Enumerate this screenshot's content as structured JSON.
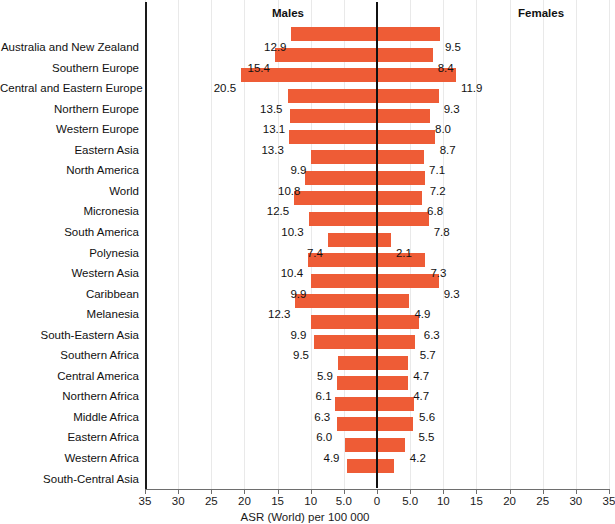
{
  "chart_data": {
    "type": "bar",
    "subtype": "population-pyramid",
    "title": "",
    "xlabel": "ASR (World) per 100 000",
    "ylabel": "",
    "grid": true,
    "legend_position": "top",
    "bar_color": "#ee5c36",
    "xlim": [
      -35,
      35
    ],
    "xticks": [
      35,
      30,
      25,
      20,
      15,
      10,
      5.0,
      0,
      5.0,
      10,
      15,
      20,
      25,
      30,
      35
    ],
    "xtick_labels": [
      "35",
      "30",
      "25",
      "20",
      "15",
      "10",
      "5.0",
      "0",
      "5.0",
      "10",
      "15",
      "20",
      "25",
      "30",
      "35"
    ],
    "panel_labels": {
      "left": "Males",
      "right": "Females"
    },
    "categories": [
      "Australia and New Zealand",
      "Southern Europe",
      "Central and Eastern Europe",
      "Northern Europe",
      "Western Europe",
      "Eastern Asia",
      "North America",
      "World",
      "Micronesia",
      "South America",
      "Polynesia",
      "Western Asia",
      "Caribbean",
      "Melanesia",
      "South-Eastern Asia",
      "Southern Africa",
      "Central America",
      "Northern Africa",
      "Middle Africa",
      "Eastern Africa",
      "Western Africa",
      "South-Central Asia"
    ],
    "series": [
      {
        "name": "Males",
        "side": "left",
        "values": [
          12.9,
          15.4,
          20.5,
          13.5,
          13.1,
          13.3,
          9.9,
          10.8,
          12.5,
          10.3,
          7.4,
          10.4,
          9.9,
          12.3,
          9.9,
          9.5,
          5.9,
          6.1,
          6.3,
          6.0,
          4.9,
          4.6
        ]
      },
      {
        "name": "Females",
        "side": "right",
        "values": [
          9.5,
          8.4,
          11.9,
          9.3,
          8.0,
          8.7,
          7.1,
          7.2,
          6.8,
          7.8,
          2.1,
          7.3,
          9.3,
          4.9,
          6.3,
          5.7,
          4.7,
          4.7,
          5.6,
          5.5,
          4.2,
          2.6
        ]
      }
    ],
    "rows": [
      {
        "category": "Australia and New Zealand",
        "male": 12.9,
        "female": 9.5,
        "male_label": "12.9",
        "female_label": "9.5"
      },
      {
        "category": "Southern Europe",
        "male": 15.4,
        "female": 8.4,
        "male_label": "15.4",
        "female_label": "8.4"
      },
      {
        "category": "Central and Eastern Europe",
        "male": 20.5,
        "female": 11.9,
        "male_label": "20.5",
        "female_label": "11.9"
      },
      {
        "category": "Northern Europe",
        "male": 13.5,
        "female": 9.3,
        "male_label": "13.5",
        "female_label": "9.3"
      },
      {
        "category": "Western Europe",
        "male": 13.1,
        "female": 8.0,
        "male_label": "13.1",
        "female_label": "8.0"
      },
      {
        "category": "Eastern Asia",
        "male": 13.3,
        "female": 8.7,
        "male_label": "13.3",
        "female_label": "8.7"
      },
      {
        "category": "North America",
        "male": 9.9,
        "female": 7.1,
        "male_label": "9.9",
        "female_label": "7.1"
      },
      {
        "category": "World",
        "male": 10.8,
        "female": 7.2,
        "male_label": "10.8",
        "female_label": "7.2"
      },
      {
        "category": "Micronesia",
        "male": 12.5,
        "female": 6.8,
        "male_label": "12.5",
        "female_label": "6.8"
      },
      {
        "category": "South America",
        "male": 10.3,
        "female": 7.8,
        "male_label": "10.3",
        "female_label": "7.8"
      },
      {
        "category": "Polynesia",
        "male": 7.4,
        "female": 2.1,
        "male_label": "7.4",
        "female_label": "2.1"
      },
      {
        "category": "Western Asia",
        "male": 10.4,
        "female": 7.3,
        "male_label": "10.4",
        "female_label": "7.3"
      },
      {
        "category": "Caribbean",
        "male": 9.9,
        "female": 9.3,
        "male_label": "9.9",
        "female_label": "9.3"
      },
      {
        "category": "Melanesia",
        "male": 12.3,
        "female": 4.9,
        "male_label": "12.3",
        "female_label": "4.9"
      },
      {
        "category": "South-Eastern Asia",
        "male": 9.9,
        "female": 6.3,
        "male_label": "9.9",
        "female_label": "6.3"
      },
      {
        "category": "Southern Africa",
        "male": 9.5,
        "female": 5.7,
        "male_label": "9.5",
        "female_label": "5.7"
      },
      {
        "category": "Central America",
        "male": 5.9,
        "female": 4.7,
        "male_label": "5.9",
        "female_label": "4.7"
      },
      {
        "category": "Northern Africa",
        "male": 6.1,
        "female": 4.7,
        "male_label": "6.1",
        "female_label": "4.7"
      },
      {
        "category": "Middle Africa",
        "male": 6.3,
        "female": 5.6,
        "male_label": "6.3",
        "female_label": "5.6"
      },
      {
        "category": "Eastern Africa",
        "male": 6.0,
        "female": 5.5,
        "male_label": "6.0",
        "female_label": "5.5"
      },
      {
        "category": "Western Africa",
        "male": 4.9,
        "female": 4.2,
        "male_label": "4.9",
        "female_label": "4.2"
      },
      {
        "category": "South-Central Asia",
        "male": 4.6,
        "female": 2.6,
        "male_label": "",
        "female_label": ""
      }
    ]
  }
}
